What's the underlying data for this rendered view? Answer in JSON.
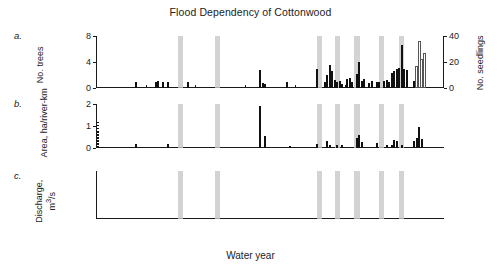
{
  "figure": {
    "title": "Flood Dependency of Cottonwood",
    "xlabel": "Water year",
    "panel_labels": [
      "a.",
      "b.",
      "c."
    ]
  },
  "chart_data": [
    {
      "type": "bar",
      "panel": "a",
      "title": "Flood Dependency of Cottonwood",
      "xlabel": "Water year",
      "ylabel": "No. trees",
      "ylabel2": "No. seedlings",
      "xlim": [
        1860,
        2000
      ],
      "ylim": [
        0,
        8
      ],
      "ylim2": [
        0,
        40
      ],
      "yticks": [
        0,
        4,
        8
      ],
      "yticks2": [
        0,
        20,
        40
      ],
      "xticks": [
        1860,
        1880,
        1900,
        1920,
        1940,
        1960,
        1980,
        2000
      ],
      "grid": false,
      "legend": "none",
      "series": [
        {
          "name": "No. trees",
          "style": "filled",
          "color": "#111111",
          "points": [
            {
              "x": 1876,
              "y": 1.0
            },
            {
              "x": 1884,
              "y": 1.0
            },
            {
              "x": 1885,
              "y": 1.1
            },
            {
              "x": 1887,
              "y": 1.0
            },
            {
              "x": 1889,
              "y": 1.0
            },
            {
              "x": 1897,
              "y": 1.0
            },
            {
              "x": 1926,
              "y": 2.8
            },
            {
              "x": 1927,
              "y": 0.7
            },
            {
              "x": 1928,
              "y": 0.6
            },
            {
              "x": 1937,
              "y": 0.9
            },
            {
              "x": 1949,
              "y": 2.9
            },
            {
              "x": 1952,
              "y": 1.0
            },
            {
              "x": 1953,
              "y": 2.0
            },
            {
              "x": 1954,
              "y": 3.5
            },
            {
              "x": 1955,
              "y": 2.6
            },
            {
              "x": 1956,
              "y": 1.2
            },
            {
              "x": 1957,
              "y": 0.9
            },
            {
              "x": 1958,
              "y": 1.1
            },
            {
              "x": 1959,
              "y": 0.6
            },
            {
              "x": 1961,
              "y": 1.4
            },
            {
              "x": 1962,
              "y": 1.5
            },
            {
              "x": 1963,
              "y": 1.0
            },
            {
              "x": 1965,
              "y": 2.2
            },
            {
              "x": 1966,
              "y": 4.0
            },
            {
              "x": 1967,
              "y": 1.1
            },
            {
              "x": 1968,
              "y": 1.4
            },
            {
              "x": 1970,
              "y": 0.8
            },
            {
              "x": 1971,
              "y": 1.1
            },
            {
              "x": 1973,
              "y": 1.0
            },
            {
              "x": 1974,
              "y": 1.0
            },
            {
              "x": 1976,
              "y": 1.1
            },
            {
              "x": 1977,
              "y": 1.3
            },
            {
              "x": 1978,
              "y": 1.0
            },
            {
              "x": 1979,
              "y": 2.3
            },
            {
              "x": 1980,
              "y": 2.6
            },
            {
              "x": 1981,
              "y": 3.0
            },
            {
              "x": 1982,
              "y": 3.1
            },
            {
              "x": 1983,
              "y": 6.6
            },
            {
              "x": 1984,
              "y": 2.9
            },
            {
              "x": 1985,
              "y": 2.8
            },
            {
              "x": 1988,
              "y": 1.1
            },
            {
              "x": 1989,
              "y": 1.9
            },
            {
              "x": 1990,
              "y": 3.4
            },
            {
              "x": 1991,
              "y": 1.0
            }
          ]
        },
        {
          "name": "No. seedlings",
          "style": "open",
          "color": "#ffffff",
          "axis": "right",
          "points": [
            {
              "x": 1989,
              "y": 17.0
            },
            {
              "x": 1990,
              "y": 36.0
            },
            {
              "x": 1991,
              "y": 22.0
            },
            {
              "x": 1992,
              "y": 27.0
            }
          ]
        }
      ]
    },
    {
      "type": "bar",
      "panel": "b",
      "ylabel": "Area, ha/river-km",
      "xlabel": "Water year",
      "xlim": [
        1860,
        2000
      ],
      "ylim": [
        0,
        2
      ],
      "yticks": [
        0,
        1,
        2
      ],
      "grid": false,
      "legend": "none",
      "series": [
        {
          "name": "Area",
          "style": "filled",
          "color": "#111111",
          "points": [
            {
              "x": 1876,
              "y": 0.16
            },
            {
              "x": 1889,
              "y": 0.17
            },
            {
              "x": 1926,
              "y": 1.9
            },
            {
              "x": 1928,
              "y": 0.55
            },
            {
              "x": 1938,
              "y": 0.07
            },
            {
              "x": 1949,
              "y": 0.18
            },
            {
              "x": 1953,
              "y": 0.3
            },
            {
              "x": 1954,
              "y": 0.12
            },
            {
              "x": 1957,
              "y": 0.12
            },
            {
              "x": 1959,
              "y": 0.14
            },
            {
              "x": 1965,
              "y": 0.45
            },
            {
              "x": 1966,
              "y": 0.6
            },
            {
              "x": 1967,
              "y": 0.28
            },
            {
              "x": 1973,
              "y": 0.22
            },
            {
              "x": 1977,
              "y": 0.12
            },
            {
              "x": 1979,
              "y": 0.14
            },
            {
              "x": 1980,
              "y": 0.35
            },
            {
              "x": 1981,
              "y": 0.3
            },
            {
              "x": 1983,
              "y": 0.12
            },
            {
              "x": 1988,
              "y": 0.3
            },
            {
              "x": 1989,
              "y": 0.45
            },
            {
              "x": 1990,
              "y": 0.95
            },
            {
              "x": 1991,
              "y": 0.4
            }
          ]
        },
        {
          "name": "pre-record marker",
          "style": "dotted-column",
          "x": 1861,
          "y_top": 1.2
        }
      ]
    },
    {
      "type": "bar",
      "panel": "c",
      "ylabel": "Discharge, m3/s",
      "xlabel": "Water year",
      "xlim": [
        1860,
        2000
      ],
      "ylim": [
        0,
        3000
      ],
      "yticks": [
        0,
        1000,
        2000,
        3000
      ],
      "grid": false,
      "legend": "none",
      "threshold": {
        "value": 1250,
        "style": "dashed"
      },
      "series": [
        {
          "name": "Annual peak discharge",
          "style": "filled",
          "color": "#111111",
          "start_year": 1880,
          "values": [
            900,
            1030,
            700,
            820,
            1280,
            1050,
            760,
            1390,
            820,
            1280,
            1320,
            960,
            700,
            1100,
            1560,
            1220,
            1250,
            980,
            860,
            1130,
            1000,
            1150,
            760,
            1210,
            1080,
            1180,
            1080,
            860,
            900,
            980,
            900,
            880,
            1060,
            1120,
            900,
            800,
            1180,
            700,
            720,
            760,
            640,
            900,
            860,
            700,
            1050,
            1200,
            2760,
            1340,
            900,
            1180,
            1000,
            980,
            1250,
            1020,
            1180,
            1340,
            720,
            700,
            740,
            900,
            880,
            980,
            1050,
            1420,
            1000,
            660,
            600,
            640,
            520,
            700,
            980,
            1180,
            1120,
            1600,
            1100,
            940,
            720,
            1400,
            2100,
            1120,
            980,
            900,
            1060,
            1180,
            1500,
            1280,
            1020,
            1380,
            900,
            1120,
            1700,
            1400,
            1000,
            1280,
            1560,
            1080,
            980,
            900,
            760,
            700,
            660,
            600,
            520,
            560,
            470,
            430,
            380,
            340,
            300,
            260,
            240,
            200
          ]
        }
      ]
    }
  ],
  "bands": {
    "label": "flood years",
    "color": "#c9c9c9",
    "years": [
      1894,
      1909,
      1950,
      1957,
      1965,
      1975,
      1983
    ]
  }
}
